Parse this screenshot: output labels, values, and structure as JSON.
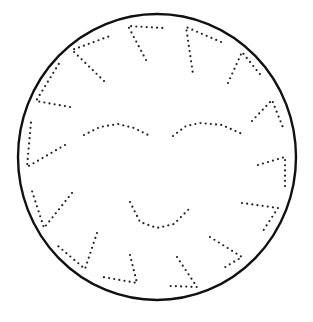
{
  "drawing": {
    "subject": "dotted sun face tracing worksheet",
    "colors": {
      "background": "#ffffff",
      "ink": "#111111"
    },
    "outline": {
      "cx": 157,
      "cy": 157,
      "rx": 139,
      "ry": 143
    },
    "rays": [
      [
        [
          146,
          60
        ],
        [
          128,
          26
        ],
        [
          163,
          28
        ]
      ],
      [
        [
          221,
          42
        ],
        [
          186,
          27
        ],
        [
          193,
          74
        ]
      ],
      [
        [
          228,
          83
        ],
        [
          242,
          52
        ],
        [
          263,
          78
        ]
      ],
      [
        [
          252,
          121
        ],
        [
          272,
          100
        ],
        [
          284,
          130
        ]
      ],
      [
        [
          258,
          165
        ],
        [
          285,
          157
        ],
        [
          285,
          190
        ]
      ],
      [
        [
          242,
          203
        ],
        [
          278,
          208
        ],
        [
          261,
          234
        ]
      ],
      [
        [
          210,
          237
        ],
        [
          242,
          257
        ],
        [
          222,
          269
        ]
      ],
      [
        [
          177,
          257
        ],
        [
          197,
          287
        ],
        [
          170,
          286
        ]
      ],
      [
        [
          130,
          255
        ],
        [
          137,
          283
        ],
        [
          103,
          277
        ]
      ],
      [
        [
          97,
          233
        ],
        [
          85,
          269
        ],
        [
          58,
          246
        ]
      ],
      [
        [
          72,
          193
        ],
        [
          44,
          228
        ],
        [
          31,
          188
        ]
      ],
      [
        [
          65,
          145
        ],
        [
          27,
          167
        ],
        [
          31,
          122
        ]
      ],
      [
        [
          70,
          107
        ],
        [
          36,
          101
        ],
        [
          60,
          62
        ]
      ],
      [
        [
          104,
          81
        ],
        [
          72,
          50
        ],
        [
          110,
          36
        ]
      ]
    ],
    "face": {
      "left_eye": [
        [
          84,
          135
        ],
        [
          100,
          127
        ],
        [
          118,
          124
        ],
        [
          134,
          128
        ],
        [
          148,
          135
        ]
      ],
      "right_eye": [
        [
          173,
          136
        ],
        [
          186,
          126
        ],
        [
          200,
          123
        ],
        [
          222,
          125
        ],
        [
          242,
          134
        ]
      ],
      "mouth": [
        [
          130,
          202
        ],
        [
          140,
          222
        ],
        [
          157,
          228
        ],
        [
          174,
          224
        ],
        [
          190,
          208
        ]
      ]
    }
  }
}
